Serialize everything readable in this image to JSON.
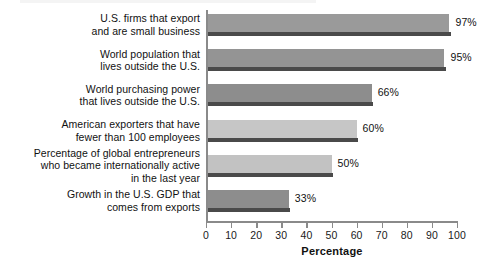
{
  "chart_data": {
    "type": "bar",
    "orientation": "horizontal",
    "title": "",
    "subtitle": "",
    "xlabel": "Percentage",
    "ylabel": "",
    "xlim": [
      0,
      100
    ],
    "xticks": [
      0,
      10,
      20,
      30,
      40,
      50,
      60,
      70,
      80,
      90,
      100
    ],
    "xtick_labels": [
      "0",
      "10",
      "20",
      "30",
      "40",
      "50",
      "60",
      "70",
      "80",
      "90",
      "100"
    ],
    "grid": false,
    "legend": null,
    "value_label_suffix": "%",
    "categories": [
      "U.S. firms that export and are small business",
      "World population that lives outside the U.S.",
      "World purchasing power that lives outside the U.S.",
      "American exporters that have fewer than 100 employees",
      "Percentage of global entrepreneurs who became internationally active in the last year",
      "Growth in the U.S. GDP that comes from exports"
    ],
    "values": [
      97,
      95,
      66,
      60,
      50,
      33
    ],
    "value_labels": [
      "97%",
      "95%",
      "66%",
      "60%",
      "50%",
      "33%"
    ],
    "bars": [
      {
        "label_lines": [
          "U.S. firms that export",
          "and are small business"
        ],
        "value": 97,
        "value_label": "97%",
        "color": "#9a9a9a",
        "shadow_color": "#4a4a4a"
      },
      {
        "label_lines": [
          "World population that",
          "lives outside the U.S."
        ],
        "value": 95,
        "value_label": "95%",
        "color": "#949494",
        "shadow_color": "#4a4a4a"
      },
      {
        "label_lines": [
          "World purchasing power",
          "that lives outside the U.S."
        ],
        "value": 66,
        "value_label": "66%",
        "color": "#8d8d8d",
        "shadow_color": "#4a4a4a"
      },
      {
        "label_lines": [
          "American exporters that have",
          "fewer than 100 employees"
        ],
        "value": 60,
        "value_label": "60%",
        "color": "#c6c6c6",
        "shadow_color": "#4a4a4a"
      },
      {
        "label_lines": [
          "Percentage of global entrepreneurs",
          "who became internationally active",
          "in the last year"
        ],
        "value": 50,
        "value_label": "50%",
        "color": "#c2c2c2",
        "shadow_color": "#4a4a4a"
      },
      {
        "label_lines": [
          "Growth in the U.S. GDP that",
          "comes from exports"
        ],
        "value": 33,
        "value_label": "33%",
        "color": "#8d8d8d",
        "shadow_color": "#4a4a4a"
      }
    ],
    "colors": {
      "axis": "#8a8a8a",
      "text": "#111111",
      "background": "#ffffff",
      "bar_dark": "#8d8d8d",
      "bar_light": "#c4c4c4",
      "bar_shadow": "#4a4a4a"
    }
  }
}
